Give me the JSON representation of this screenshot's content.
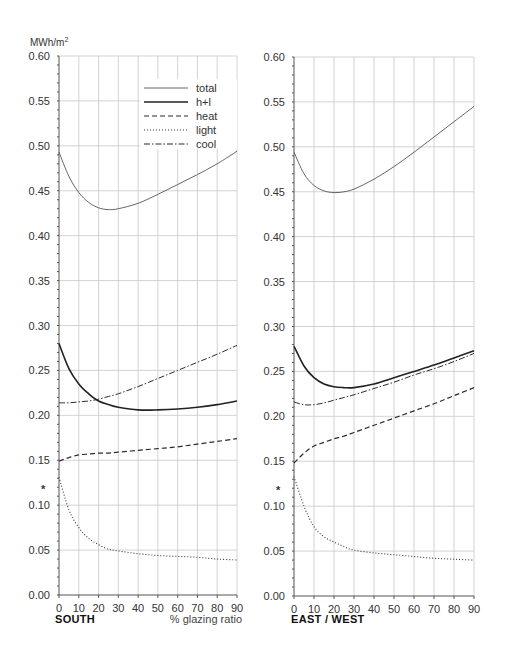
{
  "chart_data": [
    {
      "type": "line",
      "title": "SOUTH",
      "xlabel": "% glazing ratio",
      "ylabel": "MWh/m2",
      "x": [
        0,
        5,
        10,
        15,
        20,
        25,
        30,
        40,
        50,
        60,
        70,
        80,
        90
      ],
      "xlim": [
        0,
        90
      ],
      "ylim": [
        0,
        0.6
      ],
      "xticks": [
        "0",
        "10",
        "20",
        "30",
        "40",
        "50",
        "60",
        "70",
        "80",
        "90"
      ],
      "yticks": [
        "0.00",
        "0.05",
        "0.10",
        "0.15",
        "0.20",
        "0.25",
        "0.30",
        "0.35",
        "0.40",
        "0.45",
        "0.50",
        "0.55",
        "0.60"
      ],
      "grid": true,
      "legend_position": "upper right (inside)",
      "marker_annotation": {
        "symbol": "*",
        "y": 0.12
      },
      "series": [
        {
          "name": "total",
          "style": "thin solid",
          "values": [
            0.493,
            0.466,
            0.448,
            0.437,
            0.431,
            0.429,
            0.43,
            0.436,
            0.446,
            0.457,
            0.468,
            0.48,
            0.494
          ]
        },
        {
          "name": "h+l",
          "style": "thick solid",
          "values": [
            0.28,
            0.252,
            0.235,
            0.224,
            0.216,
            0.212,
            0.209,
            0.206,
            0.206,
            0.207,
            0.209,
            0.212,
            0.216
          ]
        },
        {
          "name": "heat",
          "style": "dashed",
          "values": [
            0.149,
            0.153,
            0.156,
            0.157,
            0.158,
            0.158,
            0.159,
            0.161,
            0.163,
            0.165,
            0.168,
            0.171,
            0.174
          ]
        },
        {
          "name": "light",
          "style": "dotted",
          "values": [
            0.131,
            0.095,
            0.075,
            0.063,
            0.056,
            0.051,
            0.049,
            0.046,
            0.044,
            0.043,
            0.042,
            0.04,
            0.039
          ]
        },
        {
          "name": "cool",
          "style": "dash-dot",
          "values": [
            0.214,
            0.214,
            0.215,
            0.216,
            0.218,
            0.221,
            0.224,
            0.232,
            0.241,
            0.25,
            0.259,
            0.268,
            0.278
          ]
        }
      ]
    },
    {
      "type": "line",
      "title": "EAST / WEST",
      "xlabel": "",
      "ylabel": "MWh/m2",
      "x": [
        0,
        5,
        10,
        15,
        20,
        25,
        30,
        40,
        50,
        60,
        70,
        80,
        90
      ],
      "xlim": [
        0,
        90
      ],
      "ylim": [
        0,
        0.6
      ],
      "xticks": [
        "0",
        "10",
        "20",
        "30",
        "40",
        "50",
        "60",
        "70",
        "80",
        "90"
      ],
      "yticks": [
        "0.00",
        "0.05",
        "0.10",
        "0.15",
        "0.20",
        "0.25",
        "0.30",
        "0.35",
        "0.40",
        "0.45",
        "0.50",
        "0.55",
        "0.60"
      ],
      "grid": true,
      "marker_annotation": {
        "symbol": "*",
        "y": 0.12
      },
      "series": [
        {
          "name": "total",
          "style": "thin solid",
          "values": [
            0.494,
            0.47,
            0.457,
            0.451,
            0.449,
            0.45,
            0.453,
            0.464,
            0.478,
            0.494,
            0.511,
            0.528,
            0.545
          ]
        },
        {
          "name": "h+l",
          "style": "thick solid",
          "values": [
            0.278,
            0.256,
            0.243,
            0.236,
            0.233,
            0.232,
            0.232,
            0.236,
            0.243,
            0.25,
            0.257,
            0.265,
            0.273
          ]
        },
        {
          "name": "heat",
          "style": "dashed",
          "values": [
            0.148,
            0.159,
            0.167,
            0.171,
            0.175,
            0.178,
            0.182,
            0.19,
            0.198,
            0.206,
            0.214,
            0.223,
            0.232
          ]
        },
        {
          "name": "light",
          "style": "dotted",
          "values": [
            0.133,
            0.1,
            0.077,
            0.066,
            0.06,
            0.055,
            0.051,
            0.048,
            0.046,
            0.044,
            0.042,
            0.041,
            0.04
          ]
        },
        {
          "name": "cool",
          "style": "dash-dot",
          "values": [
            0.216,
            0.213,
            0.213,
            0.215,
            0.218,
            0.221,
            0.224,
            0.231,
            0.238,
            0.246,
            0.253,
            0.261,
            0.27
          ]
        }
      ]
    }
  ],
  "legend": {
    "items": [
      {
        "label": "total",
        "style": "thin solid"
      },
      {
        "label": "h+l",
        "style": "thick solid"
      },
      {
        "label": "heat",
        "style": "dashed"
      },
      {
        "label": "light",
        "style": "dotted"
      },
      {
        "label": "cool",
        "style": "dash-dot"
      }
    ]
  },
  "labels": {
    "unit": "MWh/m",
    "unit_sup": "2",
    "south": "SOUTH",
    "eastwest": "EAST / WEST",
    "xaxis": "% glazing ratio",
    "marker": "*"
  },
  "colors": {
    "line": "#2b2b2b",
    "grid": "#c8c8c8",
    "axis": "#555555"
  }
}
